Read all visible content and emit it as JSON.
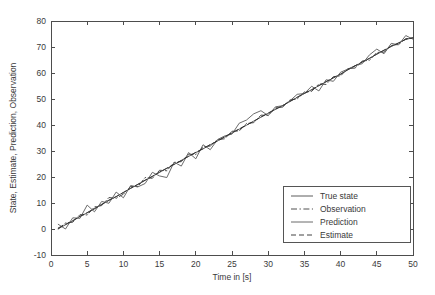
{
  "chart_data": {
    "type": "line",
    "title": "",
    "xlabel": "Time in [s]",
    "ylabel": "State, Estimate, Prediction, Observation",
    "xlim": [
      0,
      50
    ],
    "ylim": [
      -10,
      80
    ],
    "xticks": [
      0,
      5,
      10,
      15,
      20,
      25,
      30,
      35,
      40,
      45,
      50
    ],
    "yticks": [
      -10,
      0,
      10,
      20,
      30,
      40,
      50,
      60,
      70,
      80
    ],
    "grid": false,
    "legend_position": "lower right",
    "x": [
      1,
      2,
      3,
      4,
      5,
      6,
      7,
      8,
      9,
      10,
      11,
      12,
      13,
      14,
      15,
      16,
      17,
      18,
      19,
      20,
      21,
      22,
      23,
      24,
      25,
      26,
      27,
      28,
      29,
      30,
      31,
      32,
      33,
      34,
      35,
      36,
      37,
      38,
      39,
      40,
      41,
      42,
      43,
      44,
      45,
      46,
      47,
      48,
      49,
      50
    ],
    "series": [
      {
        "name": "True state",
        "style": "solid",
        "color": "#4a4a4a",
        "values": [
          0.1,
          1.6,
          3.1,
          4.8,
          6.2,
          7.7,
          9.5,
          11.0,
          12.4,
          14.1,
          15.6,
          17.1,
          18.7,
          20.3,
          21.8,
          23.3,
          24.8,
          26.4,
          27.9,
          29.4,
          30.8,
          32.4,
          33.9,
          35.4,
          36.9,
          38.4,
          39.9,
          41.5,
          43.0,
          44.5,
          46.0,
          47.5,
          49.0,
          50.6,
          52.1,
          53.6,
          55.1,
          56.6,
          58.1,
          59.6,
          61.2,
          62.7,
          64.2,
          65.7,
          67.2,
          68.7,
          70.2,
          71.6,
          72.9,
          73.6
        ]
      },
      {
        "name": "Observation",
        "style": "dashdot",
        "color": "#3c3c3c",
        "values": [
          0.0,
          2.3,
          2.6,
          5.5,
          5.4,
          8.5,
          9.0,
          12.1,
          11.8,
          13.4,
          16.4,
          16.3,
          19.8,
          19.5,
          22.6,
          22.4,
          25.6,
          25.9,
          28.8,
          28.6,
          31.6,
          31.9,
          34.4,
          34.7,
          37.6,
          37.7,
          40.6,
          40.9,
          43.8,
          43.7,
          46.6,
          46.9,
          49.6,
          50.0,
          52.7,
          52.9,
          55.8,
          55.6,
          58.6,
          58.9,
          61.7,
          61.9,
          64.6,
          64.9,
          67.9,
          68.0,
          70.6,
          71.0,
          73.2,
          73.4
        ]
      },
      {
        "name": "Prediction",
        "style": "solid",
        "color": "#5a5a5a",
        "values": [
          1.8,
          0.0,
          4.3,
          4.1,
          9.2,
          6.6,
          10.6,
          9.9,
          14.2,
          12.0,
          16.7,
          16.2,
          17.5,
          21.8,
          20.4,
          19.8,
          25.7,
          24.2,
          29.4,
          27.0,
          32.4,
          30.5,
          34.4,
          35.8,
          36.5,
          40.7,
          41.9,
          44.3,
          45.5,
          43.6,
          47.0,
          47.4,
          49.3,
          51.8,
          52.1,
          54.9,
          53.1,
          57.4,
          56.8,
          60.3,
          61.5,
          62.8,
          63.6,
          67.0,
          69.2,
          67.4,
          71.4,
          70.8,
          74.4,
          73.0
        ]
      },
      {
        "name": "Estimate",
        "style": "dashed",
        "color": "#2e2e2e",
        "values": [
          0.4,
          1.8,
          3.2,
          4.9,
          6.3,
          7.9,
          9.4,
          11.1,
          12.5,
          14.0,
          15.7,
          17.2,
          18.8,
          20.2,
          21.9,
          23.4,
          24.9,
          26.3,
          28.0,
          29.5,
          30.9,
          32.5,
          33.8,
          35.5,
          37.0,
          38.5,
          40.0,
          41.4,
          43.1,
          44.6,
          46.1,
          47.4,
          49.1,
          50.7,
          52.2,
          53.5,
          55.2,
          56.7,
          58.2,
          59.5,
          61.3,
          62.8,
          64.3,
          65.6,
          67.3,
          68.8,
          70.3,
          71.5,
          73.0,
          73.5
        ]
      }
    ]
  },
  "legend": {
    "entries": [
      {
        "label": "True state"
      },
      {
        "label": "Observation"
      },
      {
        "label": "Prediction"
      },
      {
        "label": "Estimate"
      }
    ]
  },
  "axes": {
    "xlabel": "Time in [s]",
    "ylabel": "State, Estimate, Prediction, Observation",
    "xticklabels": [
      "0",
      "5",
      "10",
      "15",
      "20",
      "25",
      "30",
      "35",
      "40",
      "45",
      "50"
    ],
    "yticklabels": [
      "-10",
      "0",
      "10",
      "20",
      "30",
      "40",
      "50",
      "60",
      "70",
      "80"
    ]
  },
  "colors": {
    "background": "#ffffff",
    "axis": "#4d4d4d",
    "text": "#3a3a3a"
  }
}
